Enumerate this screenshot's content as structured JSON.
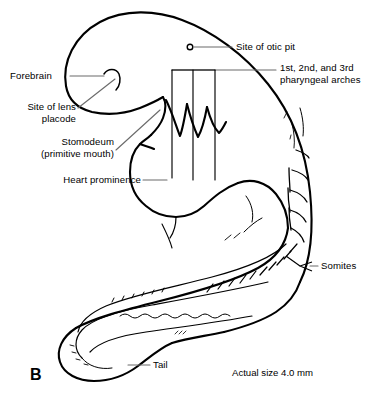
{
  "figure": {
    "panel_letter": "B",
    "caption": "Actual size 4.0 mm"
  },
  "labels": {
    "forebrain": "Forebrain",
    "lens_placode_line1": "Site of lens",
    "lens_placode_line2": "placode",
    "stomodeum_line1": "Stomodeum",
    "stomodeum_line2": "(primitive mouth)",
    "heart_prominence": "Heart prominence",
    "otic_pit": "Site of otic pit",
    "pharyngeal_arches_line1": "1st, 2nd, and 3rd",
    "pharyngeal_arches_line2": "pharyngeal arches",
    "somites": "Somites",
    "tail": "Tail"
  },
  "colors": {
    "ink": "#000000",
    "leader": "#6b6b6b",
    "background": "#ffffff"
  }
}
